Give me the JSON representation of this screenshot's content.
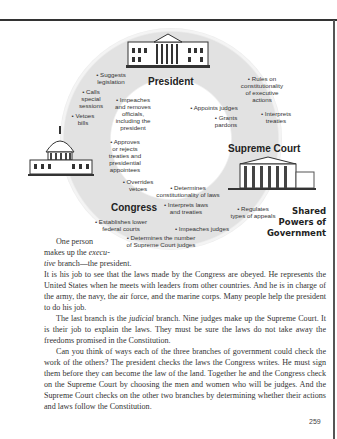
{
  "diagram": {
    "title": "Shared\nPowers of\nGovernment",
    "branches": {
      "president": "President",
      "supreme_court": "Supreme Court",
      "congress": "Congress"
    },
    "congress_over_president": [
      "• Suggests\nlegislation",
      "• Calls\nspecial\nsessions",
      "• Vetoes\nbills"
    ],
    "congress_powers_on_president": [
      "• Impeaches\nand removes\nofficials,\nincluding the\npresident",
      "• Approves\nor rejects\ntreaties and\npresidential\nappointees",
      "• Overrides\nvetoes"
    ],
    "president_on_court": [
      "• Appoints judges",
      "• Grants\npardons"
    ],
    "court_on_president": [
      "• Rules on\nconstitutionality\nof executive\nactions",
      "• Interprets\ntreaties"
    ],
    "court_on_congress": [
      "• Determines\nconstitutionality of laws",
      "• Interprets laws\nand treaties"
    ],
    "congress_on_court": [
      "• Regulates\ntypes of appeals",
      "• Impeaches judges",
      "• Establishes lower\nfederal courts",
      "• Determines the number\nof Supreme Court judges"
    ]
  },
  "text": {
    "intro_1": "One person",
    "intro_2": "makes up the ",
    "intro_em": "execu-",
    "intro_3_em": "tive",
    "intro_3": " branch—the president.",
    "p1": "It is his job to see that the laws made by the Congress are obeyed. He represents the United States when he meets with leaders from other countries. And he is in charge of the army, the navy, the air force, and the marine corps. Many people help the president to do his job.",
    "p2_a": "The last branch is the ",
    "p2_em": "judicial",
    "p2_b": " branch. Nine judges make up the Supreme Court. It is their job to explain the laws. They must be sure the laws do not take away the freedoms promised in the Constitution.",
    "p3": "Can you think of ways each of the three branches of government could check the work of the others? The president checks the laws the Congress writes. He must sign them before they can become the law of the land. Together he and the Congress check on the Supreme Court by choosing the men and women who will be judges. And the Supreme Court checks on the other two branches by determining whether their actions and laws follow the Constitution."
  },
  "page_number": "259"
}
